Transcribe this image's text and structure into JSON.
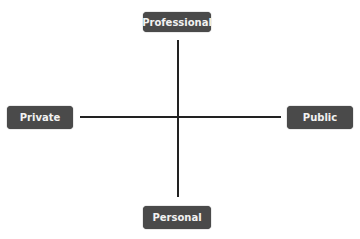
{
  "diagram": {
    "type": "quadrant-axes",
    "nodes": {
      "top": {
        "label": "Professional"
      },
      "left": {
        "label": "Private"
      },
      "right": {
        "label": "Public"
      },
      "bottom": {
        "label": "Personal"
      }
    },
    "colors": {
      "box": "#4a4a4a",
      "text": "#f2f2f2",
      "line": "#222222"
    }
  }
}
